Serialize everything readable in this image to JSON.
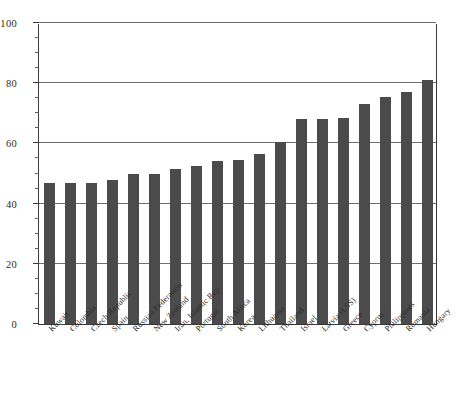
{
  "chart_data": {
    "type": "bar",
    "title": "",
    "subtitle": "",
    "xlabel": "",
    "ylabel": "",
    "ylim": [
      0,
      100
    ],
    "grid": true,
    "legend": null,
    "y_ticks": [
      0,
      20,
      40,
      60,
      80,
      100
    ],
    "y_tick_labels": [
      "0",
      "20",
      "40",
      "60",
      "80",
      "100"
    ],
    "y_minor_tick_step": 5,
    "bar_color": "#4b4b4b",
    "axis_color": "#3a3a3a",
    "gridline_color": "#6e6e6e",
    "categories": [
      "Kuwait",
      "Colombia",
      "Czech Republic",
      "Spain",
      "Russian Federation",
      "New Zealand",
      "Iran, Islamic Rep.",
      "Portugal",
      "South Africa",
      "Korea",
      "Lithuania",
      "Thailand",
      "Israel",
      "Latvia (LSS)",
      "Greece",
      "Cyprus",
      "Philippines",
      "Romania",
      "Hungary"
    ],
    "values": [
      47,
      47,
      47,
      48,
      50,
      50,
      51.5,
      52.5,
      54,
      54.5,
      56.5,
      60.5,
      68,
      68,
      68.5,
      73,
      75.5,
      77,
      81
    ]
  }
}
